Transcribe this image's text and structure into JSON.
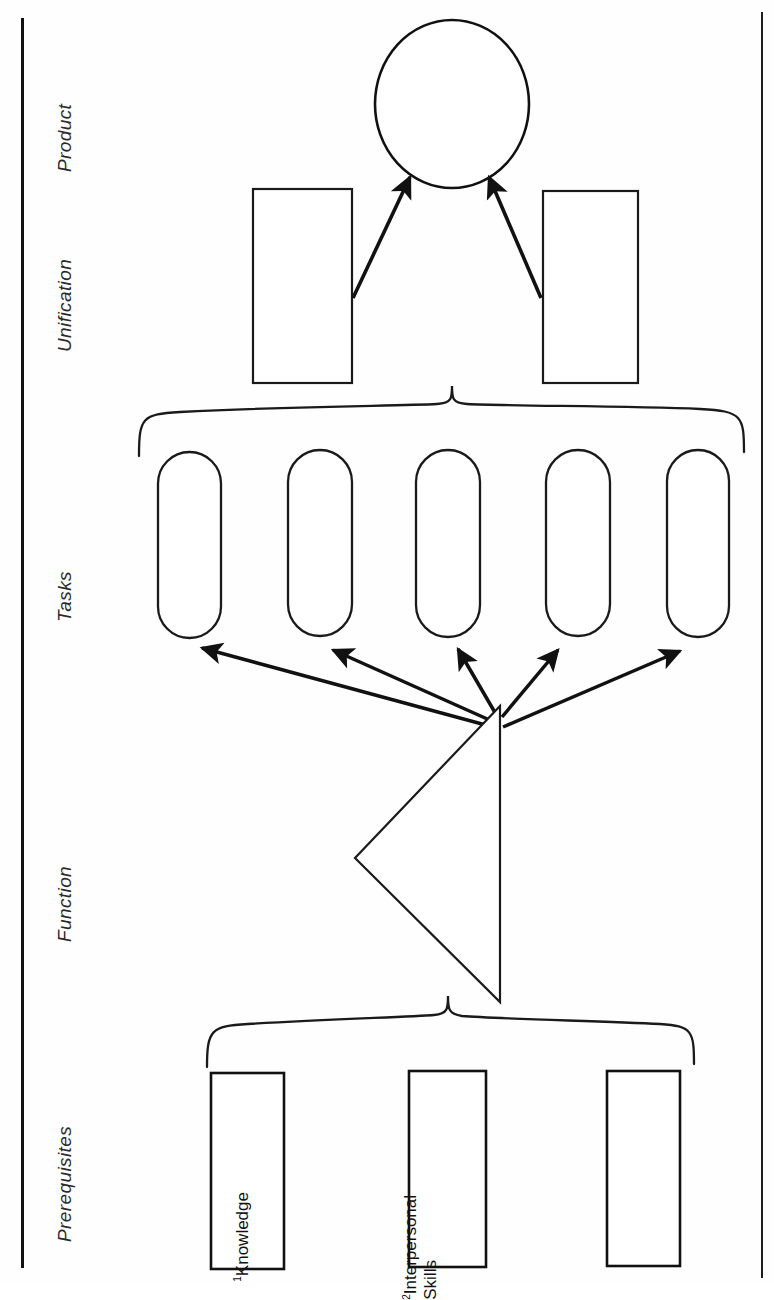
{
  "figure": {
    "orientation": "rotated-90-ccw",
    "stages": [
      {
        "key": "prerequisites",
        "label": "Prerequisites"
      },
      {
        "key": "function",
        "label": "Function"
      },
      {
        "key": "tasks",
        "label": "Tasks"
      },
      {
        "key": "unification",
        "label": "Unification"
      },
      {
        "key": "product",
        "label": "Product"
      }
    ],
    "nodes": {
      "prerequisites": [
        {
          "id": "prereq-1",
          "marker": "1",
          "line1": "Knowledge",
          "line2": ""
        },
        {
          "id": "prereq-2",
          "marker": "2",
          "line1": "Interpersonal",
          "line2": "Skills"
        },
        {
          "id": "prereq-3",
          "marker": "",
          "line1": "",
          "line2": ""
        }
      ],
      "function": [
        {
          "id": "function-triangle",
          "label": ""
        }
      ],
      "tasks": [
        {
          "id": "task-1",
          "label": ""
        },
        {
          "id": "task-2",
          "label": ""
        },
        {
          "id": "task-3",
          "label": ""
        },
        {
          "id": "task-4",
          "label": ""
        },
        {
          "id": "task-5",
          "label": ""
        }
      ],
      "unification": [
        {
          "id": "unification-1",
          "label": ""
        },
        {
          "id": "unification-2",
          "label": ""
        }
      ],
      "product": [
        {
          "id": "product-ellipse",
          "label": ""
        }
      ]
    },
    "braces": [
      {
        "id": "brace-prerequisites",
        "spans": "prerequisites",
        "points_to": "function"
      },
      {
        "id": "brace-tasks",
        "spans": "tasks",
        "points_to": "unification"
      }
    ],
    "arrows": {
      "function_to_tasks": 5,
      "unification_to_product": 2
    },
    "colors": {
      "ink": "#111111",
      "label_ink": "#2a2a2a",
      "paper": "#fefefe",
      "stroke_thin": "#1a1a1a"
    }
  }
}
